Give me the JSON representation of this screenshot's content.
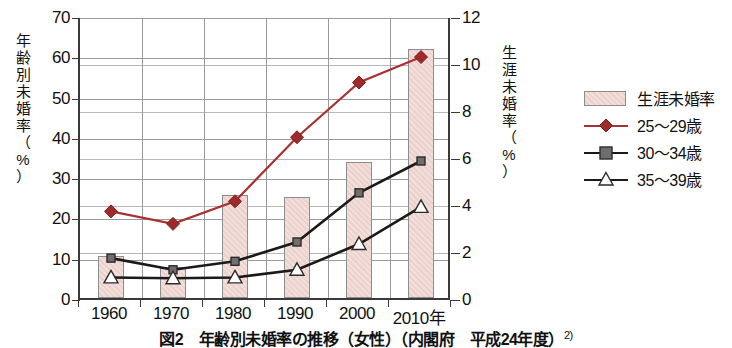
{
  "chart_data": {
    "type": "bar",
    "title": "図2　年齢別未婚率の推移（女性）（内閣府　平成24年度）",
    "title_sup": "2)",
    "xlabel": "",
    "x_unit_suffix": "年",
    "categories": [
      "1960",
      "1970",
      "1980",
      "1990",
      "2000",
      "2010"
    ],
    "xticklabels": [
      "1960",
      "1970",
      "1980",
      "1990",
      "2000",
      "2010年"
    ],
    "grid": true,
    "legend_position": "right",
    "left_axis": {
      "label": "年齢別未婚率",
      "unit": "（%）",
      "unit_chars": [
        "（",
        "%",
        "）"
      ],
      "label_chars": [
        "年",
        "齢",
        "別",
        "未",
        "婚",
        "率"
      ],
      "ylim": [
        0,
        70
      ],
      "ticks": [
        0,
        10,
        20,
        30,
        40,
        50,
        60,
        70
      ]
    },
    "right_axis": {
      "label": "生涯未婚率",
      "unit": "（%）",
      "unit_chars": [
        "（",
        "%",
        "）"
      ],
      "label_chars": [
        "生",
        "涯",
        "未",
        "婚",
        "率"
      ],
      "ylim": [
        0,
        12
      ],
      "ticks": [
        0,
        2,
        4,
        6,
        8,
        10,
        12
      ]
    },
    "series": [
      {
        "name": "生涯未婚率",
        "kind": "bar",
        "axis": "right",
        "color": "#eed4ce",
        "edge_color": "#8d8d8d",
        "values": [
          1.8,
          1.3,
          4.4,
          4.3,
          5.8,
          10.6
        ],
        "values_left_axis_equivalent": [
          10.5,
          7.5,
          26.0,
          25.5,
          34.0,
          62.0
        ]
      },
      {
        "name": "25〜29歳",
        "kind": "line",
        "axis": "left",
        "marker": "diamond",
        "color": "#a83232",
        "values": [
          22.0,
          18.9,
          24.5,
          40.4,
          54.0,
          60.3
        ]
      },
      {
        "name": "30〜34歳",
        "kind": "line",
        "axis": "left",
        "marker": "square",
        "color": "#1a1a1a",
        "marker_fill": "#6e6e6e",
        "values": [
          10.4,
          7.5,
          9.6,
          14.4,
          26.6,
          34.5
        ]
      },
      {
        "name": "35〜39歳",
        "kind": "line",
        "axis": "left",
        "marker": "triangle",
        "color": "#1a1a1a",
        "marker_fill": "#ffffff",
        "values": [
          5.6,
          5.4,
          5.6,
          7.5,
          13.9,
          23.1
        ]
      }
    ]
  }
}
